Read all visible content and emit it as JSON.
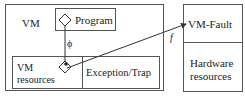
{
  "diagram": {
    "vm_box": {
      "label": "VM"
    },
    "program_box": {
      "label": "Program"
    },
    "vm_resources_box": {
      "label_line1": "VM",
      "label_line2": "resources"
    },
    "exception_box": {
      "label": "Exception/Trap"
    },
    "right_box": {
      "top_label": "VM-Fault",
      "bottom_label_line1": "Hardware",
      "bottom_label_line2": "resources"
    },
    "edges": [
      {
        "from": "program",
        "to": "vm_resources",
        "label": "ϕ"
      },
      {
        "from": "vm_resources",
        "to": "vm_fault",
        "label": "f"
      }
    ],
    "colors": {
      "line": "#555555",
      "arrow": "#333333",
      "text": "#222222"
    }
  }
}
